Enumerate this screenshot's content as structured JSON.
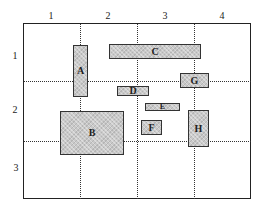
{
  "diagram": {
    "type": "grid-layout-blocks",
    "column_labels": [
      "1",
      "2",
      "3",
      "4"
    ],
    "row_labels": [
      "1",
      "2",
      "3"
    ],
    "blocks": [
      {
        "id": "A",
        "label": "A",
        "x": 73,
        "y": 45,
        "w": 15,
        "h": 52
      },
      {
        "id": "C",
        "label": "C",
        "x": 109,
        "y": 44,
        "w": 92,
        "h": 15
      },
      {
        "id": "G",
        "label": "G",
        "x": 180,
        "y": 73,
        "w": 29,
        "h": 15
      },
      {
        "id": "D",
        "label": "D",
        "x": 117,
        "y": 86,
        "w": 32,
        "h": 10
      },
      {
        "id": "E",
        "label": "E",
        "x": 145,
        "y": 103,
        "w": 35,
        "h": 8
      },
      {
        "id": "B",
        "label": "B",
        "x": 60,
        "y": 111,
        "w": 64,
        "h": 44
      },
      {
        "id": "F",
        "label": "F",
        "x": 141,
        "y": 120,
        "w": 21,
        "h": 15
      },
      {
        "id": "H",
        "label": "H",
        "x": 188,
        "y": 110,
        "w": 21,
        "h": 37
      }
    ],
    "colors": {
      "border": "#222222",
      "block_fill": "#c9c9c9",
      "grid_line": "#333333"
    }
  }
}
